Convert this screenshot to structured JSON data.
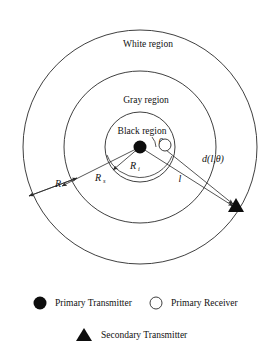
{
  "figure": {
    "type": "annular-region-diagram",
    "regions": [
      {
        "key": "white",
        "label": "White region"
      },
      {
        "key": "gray",
        "label": "Gray region"
      },
      {
        "key": "black",
        "label": "Black region"
      }
    ],
    "distance_labels": {
      "outer_radius": "R",
      "secondary_radius": "R",
      "secondary_radius_sub": "s",
      "interference_radius": "R",
      "interference_radius_sub": "i",
      "link_length": "l",
      "distance_function": "d(l,θ)",
      "angle": "θ"
    },
    "markers": {
      "primary_transmitter": "filled-circle",
      "primary_receiver": "hollow-circle",
      "secondary_transmitter": "filled-triangle"
    },
    "colors": {
      "stroke": "#2a2a2a",
      "fill": "#0d0d0d",
      "background": "#ffffff"
    }
  },
  "legend": {
    "items": [
      {
        "marker": "filled-circle",
        "label": "Primary Transmitter"
      },
      {
        "marker": "hollow-circle",
        "label": "Primary Receiver"
      },
      {
        "marker": "filled-triangle",
        "label": "Secondary Transmitter"
      }
    ]
  },
  "geometry": {
    "center": {
      "x": 140,
      "y": 147
    },
    "radii": {
      "outer": 117,
      "middle": 76,
      "inner": 35
    },
    "secondary_transmitter": {
      "x": 236,
      "y": 207
    },
    "primary_receiver": {
      "x": 165,
      "y": 146
    }
  }
}
